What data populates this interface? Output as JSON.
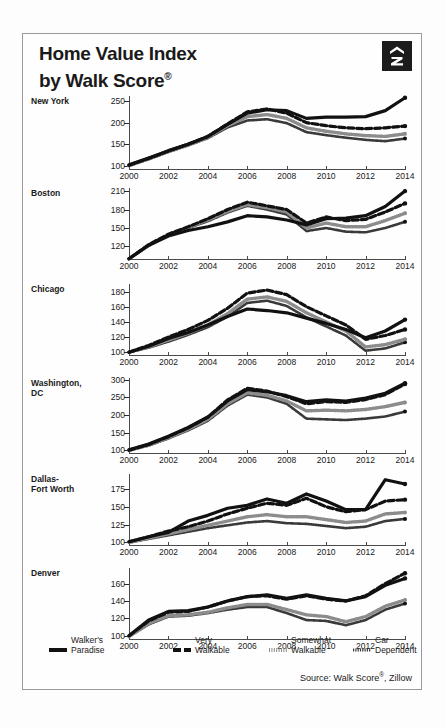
{
  "header": {
    "title_line1": "Home Value Index",
    "title_line2": "by Walk Score",
    "title_reg": "®",
    "logo_name": "zillow-logo"
  },
  "source": {
    "text_before": "Source: Walk Score",
    "reg": "®",
    "text_after": ", Zillow"
  },
  "legend": {
    "items": [
      {
        "top": "Walker's",
        "bottom": "Paradise",
        "style": "solid"
      },
      {
        "top": "Very",
        "bottom": "Walkable",
        "style": "dashed"
      },
      {
        "top": "Somewhat",
        "bottom": "Walkable",
        "style": "dotted"
      },
      {
        "top": "Car",
        "bottom": "Dependent",
        "style": "wavy"
      }
    ]
  },
  "chart_data": {
    "type": "line",
    "title": "Home Value Index by Walk Score®",
    "xlabel": "",
    "ylabel": "Home Value Index",
    "grid": false,
    "legend_position": "bottom",
    "x": [
      2000,
      2001,
      2002,
      2003,
      2004,
      2005,
      2006,
      2007,
      2008,
      2009,
      2010,
      2011,
      2012,
      2013,
      2014
    ],
    "xticks": [
      "2000",
      "2002",
      "2004",
      "2006",
      "2008",
      "2010",
      "2012",
      "2014"
    ],
    "series_names": [
      "Walker's Paradise",
      "Very Walkable",
      "Somewhat Walkable",
      "Car Dependent"
    ],
    "panels": [
      {
        "city": "New York",
        "ylim": [
          90,
          262
        ],
        "yticks": [
          100,
          150,
          200,
          250
        ],
        "series": [
          {
            "name": "Walker's Paradise",
            "style": "solid",
            "values": [
              102,
              118,
              135,
              150,
              168,
              196,
              222,
              230,
              228,
              210,
              213,
              213,
              214,
              228,
              258
            ]
          },
          {
            "name": "Very Walkable",
            "style": "dashed",
            "values": [
              101,
              117,
              134,
              150,
              168,
              197,
              225,
              232,
              222,
              200,
              193,
              188,
              186,
              188,
              192
            ]
          },
          {
            "name": "Somewhat Walkable",
            "style": "dotted",
            "values": [
              100,
              116,
              133,
              148,
              166,
              193,
              214,
              219,
              210,
              188,
              180,
              174,
              170,
              168,
              174
            ]
          },
          {
            "name": "Car Dependent",
            "style": "wavy",
            "values": [
              100,
              115,
              132,
              147,
              164,
              189,
              205,
              208,
              199,
              178,
              171,
              165,
              160,
              157,
              163
            ]
          }
        ]
      },
      {
        "city": "Boston",
        "ylim": [
          98,
          215
        ],
        "yticks": [
          120,
          150,
          180,
          210
        ],
        "series": [
          {
            "name": "Walker's Paradise",
            "style": "solid",
            "values": [
              100,
              122,
              137,
              146,
              152,
              160,
              170,
              168,
              163,
              155,
              165,
              166,
              170,
              185,
              210
            ]
          },
          {
            "name": "Very Walkable",
            "style": "dashed",
            "values": [
              100,
              123,
              140,
              152,
              165,
              180,
              192,
              186,
              180,
              158,
              168,
              162,
              164,
              176,
              190
            ]
          },
          {
            "name": "Somewhat Walkable",
            "style": "dotted",
            "values": [
              100,
              122,
              139,
              151,
              163,
              177,
              188,
              183,
              176,
              150,
              158,
              152,
              152,
              162,
              174
            ]
          },
          {
            "name": "Car Dependent",
            "style": "wavy",
            "values": [
              100,
              121,
              138,
              150,
              161,
              175,
              186,
              180,
              172,
              145,
              150,
              144,
              143,
              150,
              160
            ]
          }
        ]
      },
      {
        "city": "Chicago",
        "ylim": [
          95,
          190
        ],
        "yticks": [
          100,
          120,
          140,
          160,
          180
        ],
        "series": [
          {
            "name": "Walker's Paradise",
            "style": "solid",
            "values": [
              100,
              108,
              118,
              126,
              136,
              147,
              157,
              155,
              152,
              145,
              138,
              130,
              119,
              128,
              143
            ]
          },
          {
            "name": "Very Walkable",
            "style": "dashed",
            "values": [
              100,
              109,
              120,
              130,
              142,
              158,
              178,
              182,
              176,
              160,
              148,
              136,
              117,
              122,
              130
            ]
          },
          {
            "name": "Somewhat Walkable",
            "style": "dotted",
            "values": [
              100,
              107,
              116,
              125,
              136,
              151,
              170,
              173,
              167,
              152,
              140,
              128,
              107,
              110,
              117
            ]
          },
          {
            "name": "Car Dependent",
            "style": "wavy",
            "values": [
              100,
              106,
              114,
              123,
              133,
              147,
              165,
              168,
              161,
              146,
              134,
              122,
              102,
              105,
              113
            ]
          }
        ]
      },
      {
        "city": "Washington, DC",
        "city_line1": "Washington,",
        "city_line2": "DC",
        "ylim": [
          90,
          305
        ],
        "yticks": [
          100,
          150,
          200,
          250,
          300
        ],
        "series": [
          {
            "name": "Walker's Paradise",
            "style": "solid",
            "values": [
              102,
              118,
              140,
              165,
              195,
              240,
              272,
              266,
              255,
              238,
              243,
              240,
              248,
              262,
              290
            ]
          },
          {
            "name": "Very Walkable",
            "style": "dashed",
            "values": [
              101,
              117,
              139,
              164,
              194,
              243,
              276,
              268,
              252,
              232,
              238,
              236,
              244,
              258,
              288
            ]
          },
          {
            "name": "Somewhat Walkable",
            "style": "dotted",
            "values": [
              100,
              115,
              136,
              160,
              188,
              232,
              263,
              256,
              240,
              212,
              214,
              212,
              216,
              224,
              236
            ]
          },
          {
            "name": "Car Dependent",
            "style": "wavy",
            "values": [
              100,
              114,
              134,
              157,
              184,
              227,
              258,
              250,
              232,
              190,
              188,
              186,
              190,
              196,
              210
            ]
          }
        ]
      },
      {
        "city": "Dallas-Fort Worth",
        "city_line1": "Dallas-",
        "city_line2": "Fort Worth",
        "ylim": [
          95,
          196
        ],
        "yticks": [
          100,
          125,
          150,
          175
        ],
        "series": [
          {
            "name": "Walker's Paradise",
            "style": "solid",
            "values": [
              101,
              108,
              114,
              130,
              138,
              148,
              152,
              161,
              155,
              168,
              158,
              146,
              146,
              188,
              182
            ]
          },
          {
            "name": "Very Walkable",
            "style": "dashed",
            "values": [
              101,
              108,
              116,
              122,
              130,
              140,
              148,
              155,
              152,
              162,
              150,
              143,
              146,
              158,
              160
            ]
          },
          {
            "name": "Somewhat Walkable",
            "style": "dotted",
            "values": [
              100,
              106,
              112,
              118,
              124,
              130,
              136,
              139,
              136,
              136,
              132,
              128,
              130,
              140,
              142
            ]
          },
          {
            "name": "Car Dependent",
            "style": "wavy",
            "values": [
              100,
              105,
              110,
              115,
              120,
              124,
              128,
              130,
              127,
              126,
              123,
              120,
              122,
              130,
              133
            ]
          }
        ]
      },
      {
        "city": "Denver",
        "ylim": [
          95,
          178
        ],
        "yticks": [
          100,
          120,
          140,
          160
        ],
        "series": [
          {
            "name": "Walker's Paradise",
            "style": "solid",
            "values": [
              100,
              118,
              128,
              129,
              133,
              140,
              145,
              147,
              143,
              147,
              143,
              140,
              145,
              158,
              166
            ]
          },
          {
            "name": "Very Walkable",
            "style": "dashed",
            "values": [
              100,
              117,
              127,
              128,
              133,
              140,
              145,
              146,
              142,
              146,
              142,
              140,
              146,
              160,
              172
            ]
          },
          {
            "name": "Somewhat Walkable",
            "style": "dotted",
            "values": [
              99,
              114,
              123,
              124,
              127,
              132,
              136,
              136,
              130,
              124,
              122,
              116,
              122,
              134,
              141
            ]
          },
          {
            "name": "Car Dependent",
            "style": "wavy",
            "values": [
              99,
              113,
              122,
              123,
              126,
              130,
              133,
              133,
              126,
              118,
              117,
              112,
              118,
              130,
              137
            ]
          }
        ]
      }
    ]
  }
}
